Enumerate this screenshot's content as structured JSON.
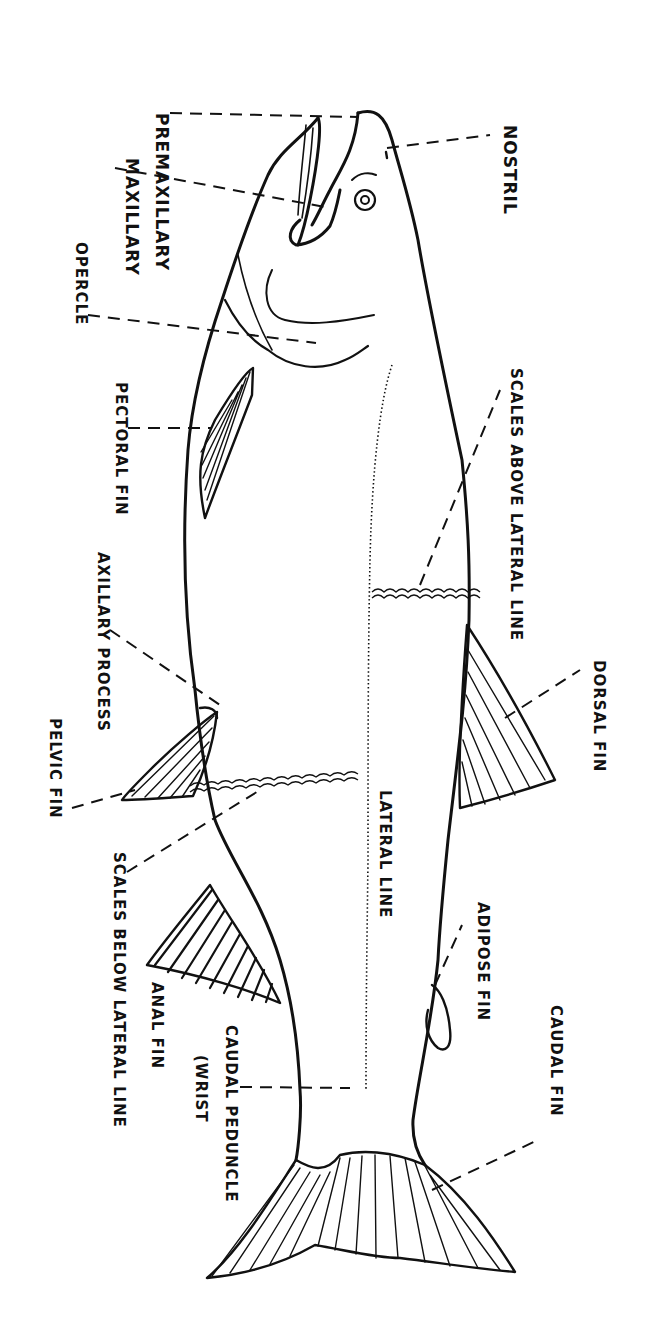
{
  "diagram": {
    "orientation": "rotated 90 degrees clockwise (head at top, tail at bottom)",
    "line_color": "#111111",
    "background": "#ffffff"
  },
  "labels": {
    "premaxillary": "PREMAXILLARY",
    "maxillary": "MAXILLARY",
    "opercle": "OPERCLE",
    "nostril": "NOSTRIL",
    "pectoral_fin": "PECTORAL FIN",
    "scales_above_lateral_line": "SCALES ABOVE LATERAL LINE",
    "axillary_process": "AXILLARY PROCESS",
    "pelvic_fin": "PELVIC FIN",
    "dorsal_fin": "DORSAL FIN",
    "lateral_line": "LATERAL LINE",
    "scales_below_lateral_line": "SCALES BELOW LATERAL LINE",
    "adipose_fin": "ADIPOSE FIN",
    "anal_fin": "ANAL FIN",
    "caudal_peduncle": "CAUDAL PEDUNCLE",
    "wrist": "(WRIST",
    "caudal_fin": "CAUDAL FIN"
  }
}
